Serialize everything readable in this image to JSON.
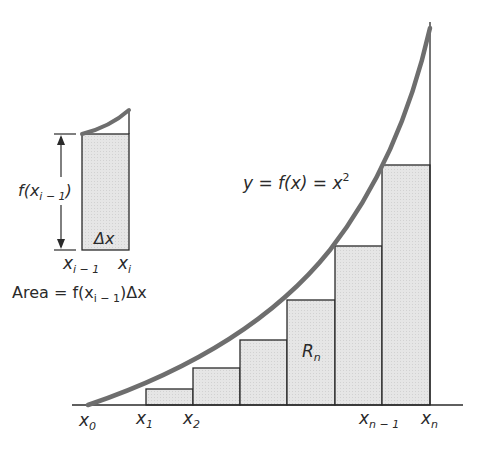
{
  "diagram": {
    "curve_label": {
      "lhs": "y = f(x) = x",
      "exp": "2"
    },
    "region_label": {
      "main": "R",
      "sub": "n"
    },
    "x_ticks": [
      {
        "main": "x",
        "sub": "0"
      },
      {
        "main": "x",
        "sub": "1"
      },
      {
        "main": "x",
        "sub": "2"
      },
      {
        "main": "x",
        "sub": "n − 1"
      },
      {
        "main": "x",
        "sub": "n"
      }
    ],
    "inset": {
      "height_label": {
        "pre": "f(x",
        "sub": "i − 1",
        "post": ")"
      },
      "width_label": "Δx",
      "left_tick": {
        "main": "x",
        "sub": "i − 1"
      },
      "right_tick": {
        "main": "x",
        "sub": "i"
      },
      "area_formula": {
        "pre": "Area = f(x",
        "sub": "i − 1",
        "post": ")Δx"
      }
    },
    "colors": {
      "curve": "#6e6e6e",
      "rect_fill": "#e4e4e4",
      "line": "#2a2a2a",
      "text": "#2a2a2a"
    },
    "rectangles": [
      {
        "x": 146,
        "top": 389,
        "right": 193
      },
      {
        "x": 193,
        "top": 368,
        "right": 240
      },
      {
        "x": 240,
        "top": 340,
        "right": 287
      },
      {
        "x": 287,
        "top": 300,
        "right": 335
      },
      {
        "x": 335,
        "top": 246,
        "right": 382
      },
      {
        "x": 382,
        "top": 165,
        "right": 430
      }
    ]
  }
}
